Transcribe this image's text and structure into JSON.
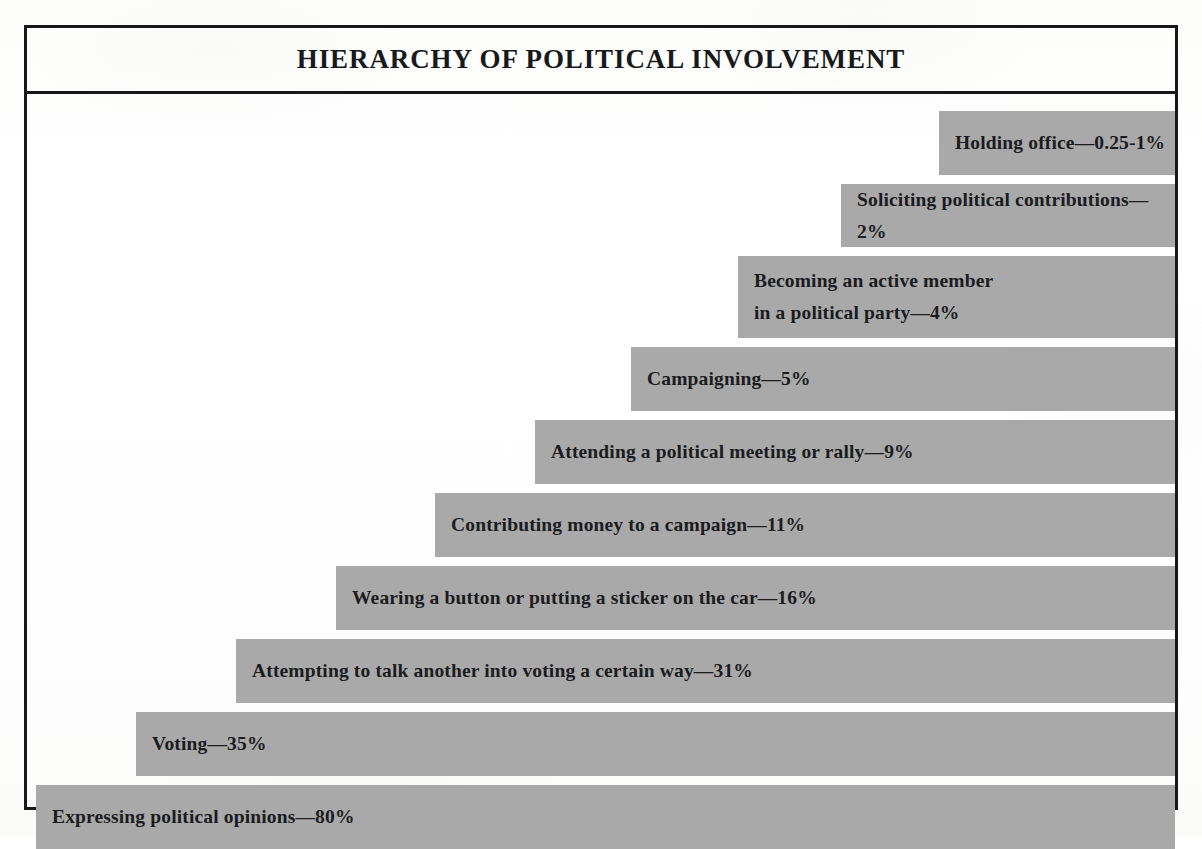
{
  "figure": {
    "title": "HIERARCHY OF POLITICAL INVOLVEMENT",
    "bar_color": "#a9a9a9",
    "frame_color": "#16181a",
    "text_color": "#1b1c1e",
    "background_color": "#ffffff"
  },
  "chart_data": {
    "type": "bar",
    "orientation": "horizontal",
    "title": "HIERARCHY OF POLITICAL INVOLVEMENT",
    "subtitle": "",
    "xlabel": "",
    "ylabel": "",
    "grid": false,
    "legend": "none",
    "value_unit": "% of population",
    "note": "Bars are right-aligned; bar length grows downward with participation rate (inverted pyramid / funnel).",
    "categories": [
      "Holding office",
      "Soliciting political contributions",
      "Becoming an active member in a political party",
      "Campaigning",
      "Attending a political meeting or rally",
      "Contributing money to a campaign",
      "Wearing a button or putting a sticker on the car",
      "Attempting to talk another into voting a certain way",
      "Voting",
      "Expressing political opinions"
    ],
    "values": [
      0.625,
      2,
      4,
      5,
      9,
      11,
      16,
      31,
      35,
      80
    ],
    "value_labels": [
      "0.25-1%",
      "2%",
      "4%",
      "5%",
      "9%",
      "11%",
      "16%",
      "31%",
      "35%",
      "80%"
    ]
  },
  "bars": [
    {
      "label": "Holding office—0.25-1%",
      "line1": "Holding office—0.25-1%",
      "category": "Holding office",
      "value_label": "0.25-1%",
      "left": 912,
      "top": 17,
      "height": 64,
      "two_line": false
    },
    {
      "label": "Soliciting political contributions—2%",
      "line1": "Soliciting political contributions—2%",
      "category": "Soliciting political contributions",
      "value_label": "2%",
      "left": 814,
      "top": 90,
      "height": 63,
      "two_line": false
    },
    {
      "label": "Becoming an active member\nin a political party—4%",
      "line1": "Becoming an active member",
      "line2": "in a political party—4%",
      "category": "Becoming an active member in a political party",
      "value_label": "4%",
      "left": 711,
      "top": 162,
      "height": 82,
      "two_line": true
    },
    {
      "label": "Campaigning—5%",
      "line1": "Campaigning—5%",
      "category": "Campaigning",
      "value_label": "5%",
      "left": 604,
      "top": 253,
      "height": 64,
      "two_line": false
    },
    {
      "label": "Attending a political meeting or rally—9%",
      "line1": "Attending a political meeting or rally—9%",
      "category": "Attending a political meeting or rally",
      "value_label": "9%",
      "left": 508,
      "top": 326,
      "height": 64,
      "two_line": false
    },
    {
      "label": "Contributing money to a campaign—11%",
      "line1": "Contributing money to a campaign—11%",
      "category": "Contributing money to a campaign",
      "value_label": "11%",
      "left": 408,
      "top": 399,
      "height": 64,
      "two_line": false
    },
    {
      "label": "Wearing a button or putting a sticker on the car—16%",
      "line1": "Wearing a button or putting a sticker on the car—16%",
      "category": "Wearing a button or putting a sticker on the car",
      "value_label": "16%",
      "left": 309,
      "top": 472,
      "height": 64,
      "two_line": false
    },
    {
      "label": "Attempting to talk another into voting a certain way—31%",
      "line1": "Attempting to talk another into voting a certain way—31%",
      "category": "Attempting to talk another into voting a certain way",
      "value_label": "31%",
      "left": 209,
      "top": 545,
      "height": 64,
      "two_line": false
    },
    {
      "label": "Voting—35%",
      "line1": "Voting—35%",
      "category": "Voting",
      "value_label": "35%",
      "left": 109,
      "top": 618,
      "height": 64,
      "two_line": false
    },
    {
      "label": "Expressing political opinions—80%",
      "line1": "Expressing political opinions—80%",
      "category": "Expressing political opinions",
      "value_label": "80%",
      "left": 9,
      "top": 691,
      "height": 64,
      "two_line": false
    }
  ]
}
